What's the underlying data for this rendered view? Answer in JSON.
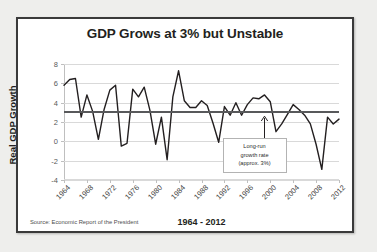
{
  "frame": {
    "border_color": "#3a3a3a",
    "background": "#ffffff"
  },
  "source_note": "Source: Economic Report of the President",
  "annotation": {
    "line1": "Long-run",
    "line2": "growth rate",
    "line3": "(approx. 3%)"
  },
  "chart_data": {
    "type": "line",
    "title": "GDP Grows at 3% but Unstable",
    "xlabel": "1964 - 2012",
    "ylabel": "Real GDP Growth",
    "ylim": [
      -4,
      8
    ],
    "yticks": [
      -4,
      -2,
      0,
      2,
      4,
      6,
      8
    ],
    "xlim": [
      1964,
      2012
    ],
    "xticks": [
      1964,
      1968,
      1972,
      1976,
      1980,
      1984,
      1988,
      1992,
      1996,
      2000,
      2004,
      2008,
      2012
    ],
    "grid": true,
    "legend": "none",
    "series": [
      {
        "name": "Real GDP Growth",
        "color": "#231f20",
        "x": [
          1964,
          1965,
          1966,
          1967,
          1968,
          1969,
          1970,
          1971,
          1972,
          1973,
          1974,
          1975,
          1976,
          1977,
          1978,
          1979,
          1980,
          1981,
          1982,
          1983,
          1984,
          1985,
          1986,
          1987,
          1988,
          1989,
          1990,
          1991,
          1992,
          1993,
          1994,
          1995,
          1996,
          1997,
          1998,
          1999,
          2000,
          2001,
          2002,
          2003,
          2004,
          2005,
          2006,
          2007,
          2008,
          2009,
          2010,
          2011,
          2012
        ],
        "values": [
          5.8,
          6.4,
          6.5,
          2.5,
          4.8,
          3.1,
          0.2,
          3.3,
          5.3,
          5.8,
          -0.5,
          -0.2,
          5.4,
          4.6,
          5.6,
          3.2,
          -0.3,
          2.5,
          -1.9,
          4.6,
          7.3,
          4.2,
          3.5,
          3.5,
          4.2,
          3.7,
          1.9,
          -0.1,
          3.6,
          2.7,
          4.0,
          2.7,
          3.8,
          4.5,
          4.4,
          4.8,
          4.1,
          1.0,
          1.8,
          2.8,
          3.8,
          3.3,
          2.7,
          1.8,
          -0.3,
          -2.9,
          2.5,
          1.8,
          2.3
        ]
      }
    ],
    "trend_line": {
      "name": "Long-run growth rate",
      "value": 3.0,
      "color": "#58595b"
    },
    "annotation_target_year": 1999
  }
}
